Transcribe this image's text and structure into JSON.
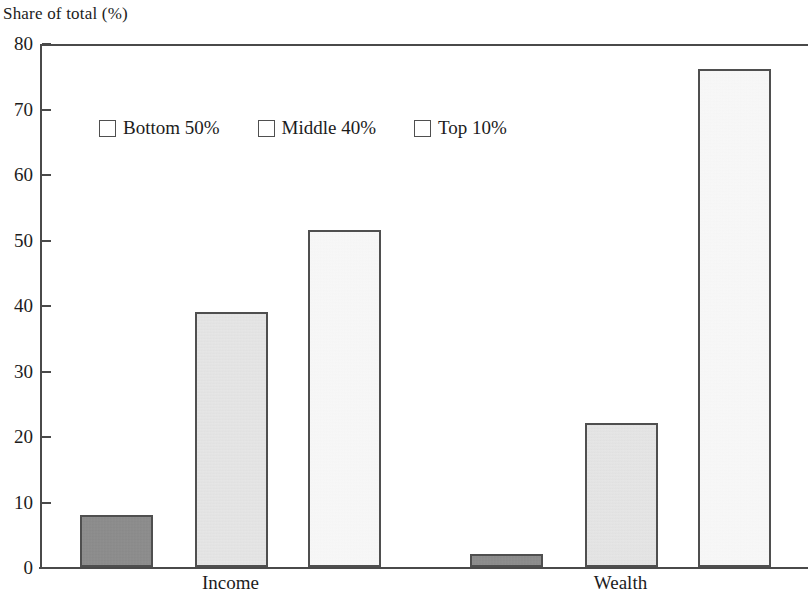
{
  "chart_data": {
    "type": "bar",
    "title": "Share of total (%)",
    "xlabel": "",
    "ylabel": "Share of total (%)",
    "categories": [
      "Income",
      "Wealth"
    ],
    "series": [
      {
        "name": "Bottom 50%",
        "values": [
          8,
          2
        ],
        "color": "#8c8c8c"
      },
      {
        "name": "Middle 40%",
        "values": [
          39,
          22
        ],
        "color": "#e2e2e2"
      },
      {
        "name": "Top 10%",
        "values": [
          51.5,
          76
        ],
        "color": "#f7f7f7"
      }
    ],
    "ylim": [
      0,
      80
    ],
    "yticks": [
      0,
      10,
      20,
      30,
      40,
      50,
      60,
      70,
      80
    ],
    "ytick_labels": [
      "0",
      "10",
      "20",
      "30",
      "40",
      "50",
      "60",
      "70",
      "80"
    ],
    "grid": false,
    "legend_position": "top-left-inside"
  },
  "axis": {
    "y_labels": [
      "80",
      "70",
      "60",
      "50",
      "40",
      "30",
      "20",
      "10",
      "0"
    ]
  },
  "legend": {
    "items": [
      {
        "label": "Bottom 50%",
        "swatch": "dark-gray-square"
      },
      {
        "label": "Middle 40%",
        "swatch": "light-gray-square"
      },
      {
        "label": "Top 10%",
        "swatch": "white-square"
      }
    ]
  },
  "groups": [
    {
      "label": "Income"
    },
    {
      "label": "Wealth"
    }
  ]
}
